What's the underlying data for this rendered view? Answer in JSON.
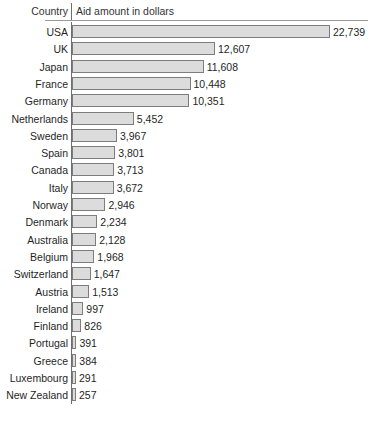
{
  "header": {
    "category_label": "Country",
    "value_label": "Aid amount in dollars"
  },
  "footnote": "",
  "chart_data": {
    "type": "bar",
    "orientation": "horizontal",
    "title": "",
    "xlabel": "Aid amount in dollars",
    "ylabel": "Country",
    "xlim": [
      0,
      22739
    ],
    "grid": false,
    "legend": null,
    "bar_fill_color": "#dcdcdc",
    "bar_border_color": "#7d7d7d",
    "categories": [
      "USA",
      "UK",
      "Japan",
      "France",
      "Germany",
      "Netherlands",
      "Sweden",
      "Spain",
      "Canada",
      "Italy",
      "Norway",
      "Denmark",
      "Australia",
      "Belgium",
      "Switzerland",
      "Austria",
      "Ireland",
      "Finland",
      "Portugal",
      "Greece",
      "Luxembourg",
      "New Zealand"
    ],
    "values": [
      22739,
      12607,
      11608,
      10448,
      10351,
      5452,
      3967,
      3801,
      3713,
      3672,
      2946,
      2234,
      2128,
      1968,
      1647,
      1513,
      997,
      826,
      391,
      384,
      291,
      257
    ],
    "value_labels": [
      "22,739",
      "12,607",
      "11,608",
      "10,448",
      "10,351",
      "5,452",
      "3,967",
      "3,801",
      "3,713",
      "3,672",
      "2,946",
      "2,234",
      "2,128",
      "1,968",
      "1,647",
      "1,513",
      "997",
      "826",
      "391",
      "384",
      "291",
      "257"
    ]
  }
}
